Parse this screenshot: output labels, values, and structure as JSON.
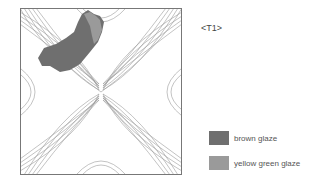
{
  "diagram": {
    "tag": "<T1>",
    "pattern": "four-petal interlocking arc tile with concentric outlines",
    "legend": [
      {
        "label": "brown glaze",
        "color": "#6f6f6f"
      },
      {
        "label": "yellow green glaze",
        "color": "#9a9a9a"
      }
    ]
  }
}
